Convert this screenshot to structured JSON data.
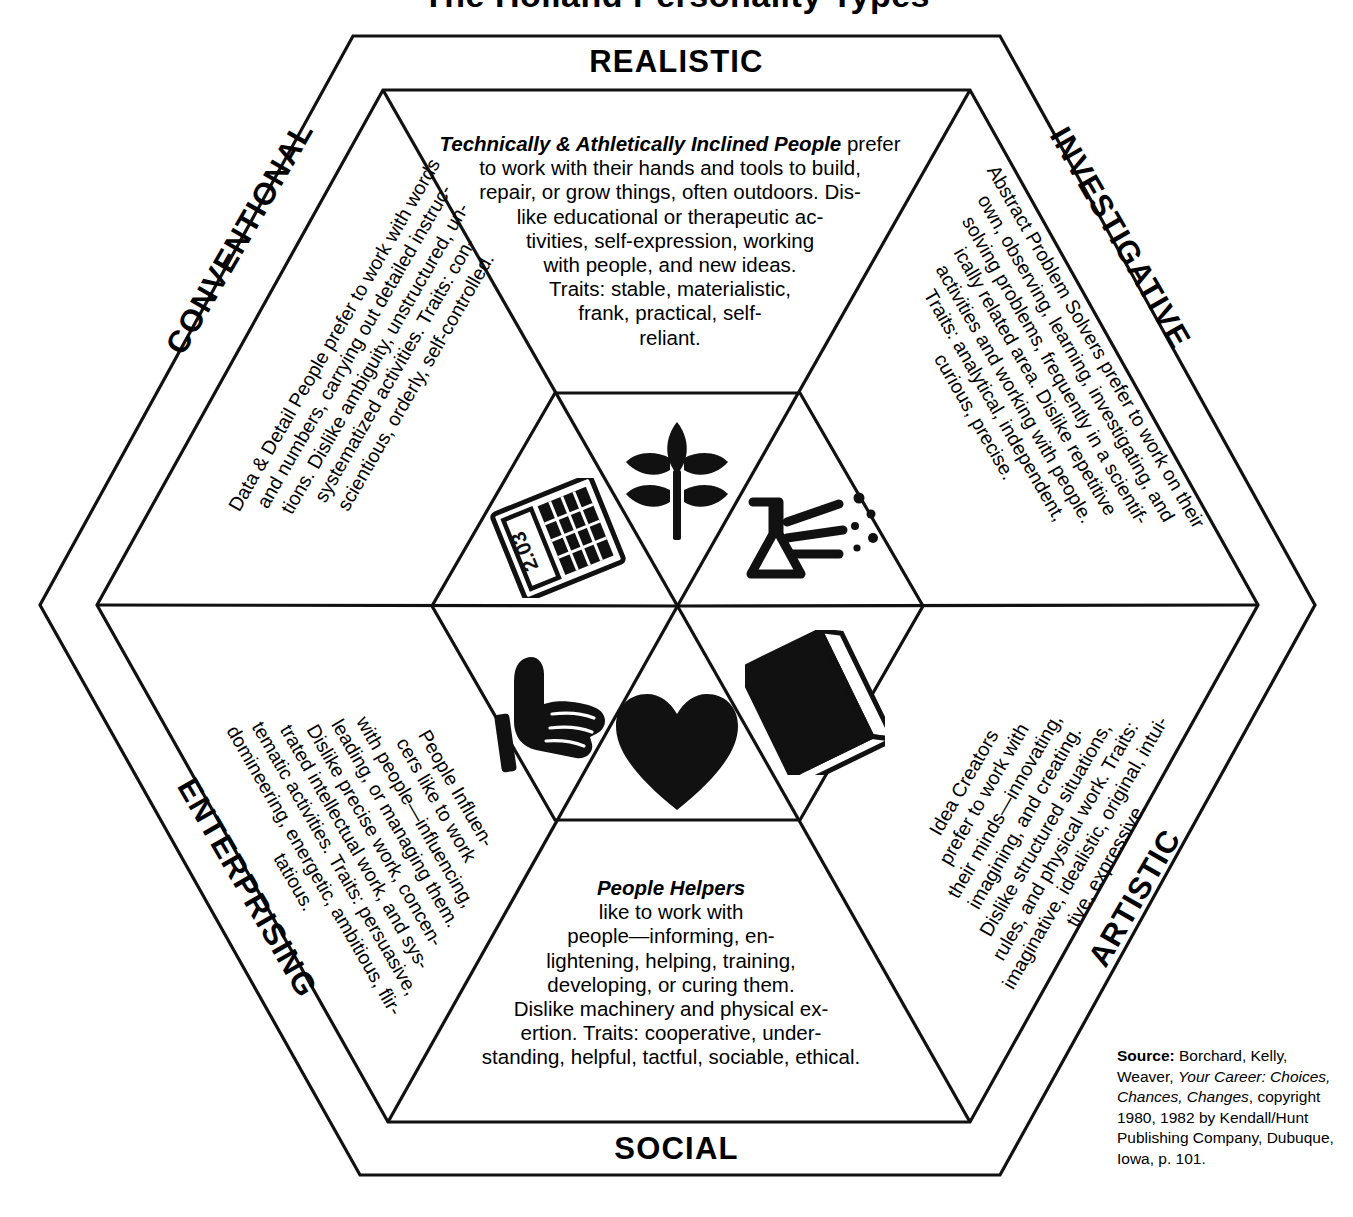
{
  "page": {
    "title": "The Holland Personality Types",
    "bg_color": "#ffffff",
    "ink_color": "#000000"
  },
  "hexagon": {
    "labels": {
      "realistic": "REALISTIC",
      "investigative": "INVESTIGATIVE",
      "artistic": "ARTISTIC",
      "social": "SOCIAL",
      "enterprising": "ENTERPRISING",
      "conventional": "CONVENTIONAL"
    },
    "sectors": [
      {
        "key": "realistic",
        "label": "REALISTIC",
        "lead": "Technically & Athletically Inclined People",
        "icon": "leaf-icon",
        "lines": [
          "Technically & Athletically Inclined People prefer",
          "to work with their hands and tools to build,",
          "repair, or grow things, often outdoors. Dis-",
          "like educational or therapeutic ac-",
          "tivities, self-expression, working",
          "with people, and new ideas.",
          "Traits: stable, materialistic,",
          "frank, practical, self-",
          "reliant."
        ],
        "text": "Technically & Athletically Inclined People prefer to work with their hands and tools to build, repair, or grow things, often outdoors. Dislike educational or therapeutic activities, self-expression, working with people, and new ideas. Traits: stable, materialistic, frank, practical, self-reliant.",
        "traits": [
          "stable",
          "materialistic",
          "frank",
          "practical",
          "self-reliant"
        ]
      },
      {
        "key": "investigative",
        "label": "INVESTIGATIVE",
        "lead": "Abstract Problem Solvers",
        "icon": "flask-icon",
        "lines": [
          "Abstract Problem Solvers prefer to work on their",
          "own, observing, learning, investigating, and",
          "solving problems, frequently in a scientif-",
          "ically related area. Dislike repetitive",
          "activities and working with people.",
          "Traits: analytical, independent,",
          "curious, precise."
        ],
        "text": "Abstract Problem Solvers prefer to work on their own, observing, learning, investigating, and solving problems, frequently in a scientifically related area. Dislike repetitive activities and working with people. Traits: analytical, independent, curious, precise.",
        "traits": [
          "analytical",
          "independent",
          "curious",
          "precise"
        ]
      },
      {
        "key": "artistic",
        "label": "ARTISTIC",
        "lead": "Idea Creators",
        "icon": "book-icon",
        "lines": [
          "Idea     Creators",
          "prefer  to  work  with",
          "their minds—innovating,",
          "imagining,  and   creating.",
          "Dislike  structured  situations,",
          "rules,  and  physical  work.  Traits:",
          "imaginative, idealistic, original, intui-",
          "tive, expressive."
        ],
        "text": "Idea Creators prefer to work with their minds—innovating, imagining, and creating. Dislike structured situations, rules, and physical work. Traits: imaginative, idealistic, original, intuitive, expressive.",
        "traits": [
          "imaginative",
          "idealistic",
          "original",
          "intuitive",
          "expressive"
        ]
      },
      {
        "key": "social",
        "label": "SOCIAL",
        "lead": "People Helpers",
        "icon": "heart-icon",
        "lines": [
          "People     Helpers",
          "like   to   work   with",
          "people—informing,  en-",
          "lightening, helping, training,",
          "developing,  or  curing  them.",
          "Dislike machinery and physical ex-",
          "ertion.  Traits:  cooperative,  under-",
          "standing, helpful, tactful, sociable, ethical."
        ],
        "text": "People Helpers like to work with people—informing, enlightening, helping, training, developing, or curing them. Dislike machinery and physical exertion. Traits: cooperative, understanding, helpful, tactful, sociable, ethical.",
        "traits": [
          "cooperative",
          "understanding",
          "helpful",
          "tactful",
          "sociable",
          "ethical"
        ]
      },
      {
        "key": "enterprising",
        "label": "ENTERPRISING",
        "lead": "People Influencers",
        "icon": "pointing-hand-icon",
        "lines": [
          "People       Influen-",
          "cers    like    to    work",
          "with people—influencing,",
          "leading, or managing them.",
          "Dislike precise work, concen-",
          "trated intellectual work, and sys-",
          "tematic activities. Traits: persuasive,",
          "domineering, energetic, ambitious, flir-",
          "tatious."
        ],
        "text": "People Influencers like to work with people—influencing, leading, or managing them. Dislike precise work, concentrated intellectual work, and systematic activities. Traits: persuasive, domineering, energetic, ambitious, flirtatious.",
        "traits": [
          "persuasive",
          "domineering",
          "energetic",
          "ambitious",
          "flirtatious"
        ]
      },
      {
        "key": "conventional",
        "label": "CONVENTIONAL",
        "lead": "Data & Detail People",
        "icon": "calculator-icon",
        "lines": [
          "Data & Detail People prefer to work with words",
          "and numbers, carrying out detailed instruc-",
          "tions. Dislike ambiguity, unstructured, un-",
          "systematized  activities.  Traits:  con-",
          "scientious, orderly, self-controlled."
        ],
        "text": "Data & Detail People prefer to work with words and numbers, carrying out detailed instructions. Dislike ambiguity, unstructured, unsystematized activities. Traits: conscientious, orderly, self-controlled.",
        "traits": [
          "conscientious",
          "orderly",
          "self-controlled"
        ]
      }
    ]
  },
  "icons": {
    "calculator_display": "2.03",
    "names": [
      "leaf-icon",
      "flask-icon",
      "book-icon",
      "heart-icon",
      "pointing-hand-icon",
      "calculator-icon"
    ]
  },
  "source": {
    "label": "Source:",
    "line1": " Borchard, Kelly,",
    "line2_pre": "Weaver, ",
    "line2_ital": "Your Career: Choices,",
    "line3_ital": "Chances, Changes",
    "line3_post": ", copyright",
    "line4": "1980, 1982 by Kendall/Hunt",
    "line5": "Publishing Company, Dubuque,",
    "line6": "Iowa, p. 101.",
    "full": "Source: Borchard, Kelly, Weaver, Your Career: Choices, Chances, Changes, copyright 1980, 1982 by Kendall/Hunt Publishing Company, Dubuque, Iowa, p. 101."
  }
}
